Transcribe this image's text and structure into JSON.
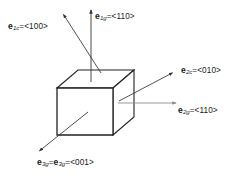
{
  "figure": {
    "background_color": "#ffffff"
  },
  "colors": {
    "cube_outline": "#222222",
    "cube_face": "#ffffff",
    "arrow_dark": "#333333",
    "arrow_gray": "#8c8c8c",
    "text": "#1a1a1a"
  },
  "cube": {
    "name": "unit-cube",
    "front_face": [
      [
        57,
        88
      ],
      [
        113,
        88
      ],
      [
        113,
        135
      ],
      [
        57,
        135
      ]
    ],
    "top_face": [
      [
        57,
        88
      ],
      [
        78,
        70
      ],
      [
        134,
        70
      ],
      [
        113,
        88
      ]
    ],
    "right_face": [
      [
        113,
        88
      ],
      [
        134,
        70
      ],
      [
        134,
        117
      ],
      [
        113,
        135
      ]
    ]
  },
  "vectors": [
    {
      "id": "e1c",
      "symbol": "e",
      "subscript": "1c",
      "sub_index": "1",
      "sub_frame": "c",
      "equals": "=",
      "direction": "<100>",
      "label_text": "e1c = <100>",
      "arrow_color": "#333333",
      "from": [
        101,
        73
      ],
      "to": [
        62,
        13
      ],
      "label_pos": [
        8,
        22
      ]
    },
    {
      "id": "e1g",
      "symbol": "e",
      "subscript": "1g",
      "sub_index": "1",
      "sub_frame": "g",
      "equals": "=",
      "direction": "<110>",
      "label_text": "e1g = <110>",
      "arrow_color": "#333333",
      "from": [
        91,
        82
      ],
      "to": [
        91,
        8
      ],
      "label_pos": [
        95,
        12
      ]
    },
    {
      "id": "e2c",
      "symbol": "e",
      "subscript": "2c",
      "sub_index": "2",
      "sub_frame": "c",
      "equals": "=",
      "direction": "<010>",
      "label_text": "e2c = <010>",
      "arrow_color": "#333333",
      "from": [
        119,
        101
      ],
      "to": [
        174,
        72
      ],
      "label_pos": [
        181,
        66
      ]
    },
    {
      "id": "e2g",
      "symbol": "e",
      "subscript": "2g",
      "sub_index": "2",
      "sub_frame": "g",
      "equals": "=",
      "direction": "<110>",
      "label_text": "e2g = <110>",
      "arrow_color": "#8c8c8c",
      "from": [
        118,
        103
      ],
      "to": [
        178,
        103
      ],
      "label_pos": [
        178,
        106
      ]
    },
    {
      "id": "e3g",
      "symbol": "e",
      "subscript": "3g",
      "sub_index": "3",
      "sub_frame": "g",
      "equals": "=",
      "direction": "<001>",
      "label_text": "e3g = e3g = <001>",
      "arrow_color": "#333333",
      "from": [
        88,
        112
      ],
      "to": [
        38,
        152
      ],
      "label_pos": [
        37,
        158
      ],
      "second_symbol": "e",
      "second_subscript": "3g",
      "second_sub_index": "3",
      "second_sub_frame": "g"
    }
  ],
  "brackets": {
    "open": "<",
    "close": ">"
  }
}
